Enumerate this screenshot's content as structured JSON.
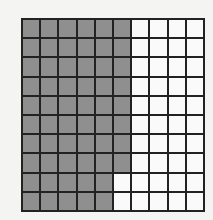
{
  "figure": {
    "type": "hundred-grid",
    "rows": 10,
    "columns": 10,
    "total_cells": 100,
    "shaded_cells": 58,
    "unshaded_cells": 42,
    "shaded_per_row": [
      6,
      6,
      6,
      6,
      6,
      6,
      6,
      6,
      5,
      5
    ],
    "colors": {
      "shaded": "#8f8f8f",
      "unshaded": "#fafafa",
      "gridline": "#222222"
    }
  }
}
